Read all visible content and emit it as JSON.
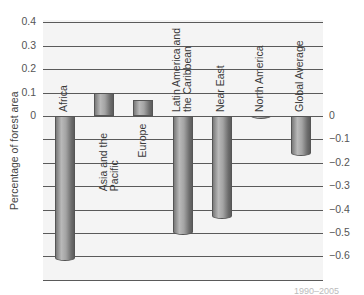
{
  "chart_data": {
    "type": "bar",
    "title": "",
    "xlabel": "",
    "ylabel": "Percentage of forest area",
    "categories": [
      "Africa",
      "Asia and the Pacific",
      "Europe",
      "Latin America and the Caribbean",
      "Near East",
      "North America",
      "Global Average"
    ],
    "category_display": [
      "Africa",
      "Asia and the\nPacific",
      "Europe",
      "Latin America and\nthe Caribbean",
      "Near East",
      "North America",
      "Global Average"
    ],
    "values": [
      -0.62,
      0.1,
      0.07,
      -0.51,
      -0.44,
      -0.01,
      -0.17
    ],
    "ylim": [
      -0.7,
      0.4
    ],
    "yticks_left": [
      "0.4",
      "0.3",
      "0.2",
      "0.1",
      "0"
    ],
    "yticks_right": [
      "0",
      "−0.1",
      "−0.2",
      "−0.3",
      "−0.4",
      "−0.5",
      "−0.6"
    ],
    "grid": true,
    "legend": null,
    "footer_note": "1990–2005",
    "bar_color": "#9a9a9a",
    "background_color": "#f4f4f4"
  }
}
